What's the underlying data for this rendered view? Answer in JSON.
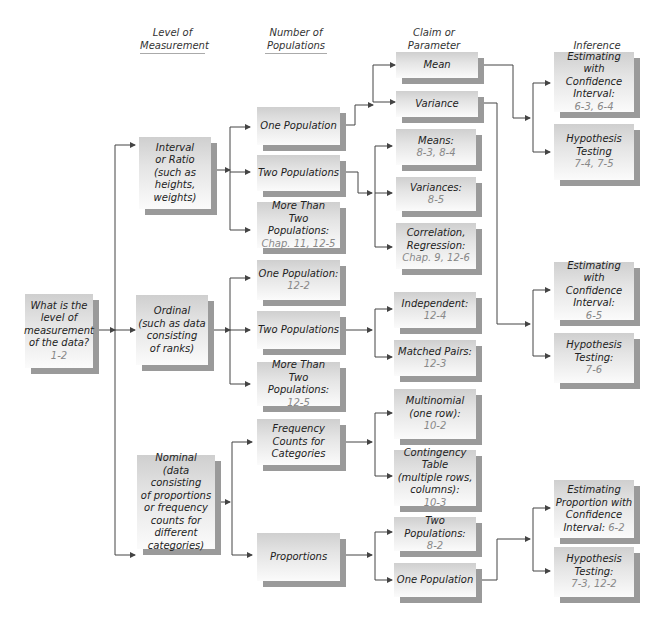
{
  "headers": {
    "level": "Level of Measurement",
    "level_l1": "Level of",
    "level_l2": "Measurement",
    "number_l1": "Number of",
    "number_l2": "Populations",
    "claim_l1": "Claim or",
    "claim_l2": "Parameter",
    "inference": "Inference"
  },
  "root": {
    "lines": [
      "What is the",
      "level of",
      "measurement",
      "of the data?"
    ],
    "ref": "1-2"
  },
  "levels": {
    "interval": {
      "lines": [
        "Interval",
        "or Ratio",
        "(such as",
        "heights,",
        "weights)"
      ]
    },
    "ordinal": {
      "lines": [
        "Ordinal",
        "(such as data",
        "consisting",
        "of ranks)"
      ]
    },
    "nominal": {
      "lines": [
        "Nominal",
        "(data consisting",
        "of proportions",
        "or frequency",
        "counts for",
        "different",
        "categories)"
      ]
    }
  },
  "populations": {
    "int_one": {
      "label": "One Population"
    },
    "int_two": {
      "label": "Two Populations"
    },
    "int_more": {
      "l1": "More Than",
      "l2": "Two Populations:",
      "ref": "Chap. 11, 12-5"
    },
    "ord_one": {
      "l1": "One Population:",
      "ref": "12-2"
    },
    "ord_two": {
      "label": "Two Populations"
    },
    "ord_more": {
      "l1": "More Than",
      "l2": "Two Populations:",
      "ref": "12-5"
    },
    "nom_freq": {
      "lines": [
        "Frequency",
        "Counts for",
        "Categories"
      ]
    },
    "nom_prop": {
      "label": "Proportions"
    }
  },
  "claims": {
    "mean": {
      "label": "Mean"
    },
    "variance": {
      "label": "Variance"
    },
    "means": {
      "l1": "Means:",
      "ref": "8-3, 8-4"
    },
    "variances": {
      "l1": "Variances:",
      "ref": "8-5"
    },
    "correlation": {
      "l1": "Correlation,",
      "l2": "Regression:",
      "ref": "Chap. 9, 12-6"
    },
    "independent": {
      "l1": "Independent:",
      "ref": "12-4"
    },
    "matched": {
      "l1": "Matched Pairs:",
      "ref": "12-3"
    },
    "multinomial": {
      "l1": "Multinomial",
      "l2": "(one row):",
      "ref": "10-2"
    },
    "contingency": {
      "l1": "Contingency Table",
      "l2": "(multiple rows,",
      "l3": "columns):",
      "ref": "10-3"
    },
    "two_pop": {
      "l1": "Two Populations:",
      "ref": "8-2"
    },
    "one_pop": {
      "label": "One Population"
    }
  },
  "inference": {
    "est1": {
      "l1": "Estimating",
      "l2": "with Confidence",
      "l3": "Interval:",
      "ref": "6-3, 6-4"
    },
    "hyp1": {
      "l1": "Hypothesis",
      "l2": "Testing",
      "ref": "7-4, 7-5"
    },
    "est2": {
      "l1": "Estimating",
      "l2": "with Confidence",
      "l3": "Interval:",
      "ref": "6-5"
    },
    "hyp2": {
      "l1": "Hypothesis",
      "l2": "Testing:",
      "ref": "7-6"
    },
    "est3": {
      "l1": "Estimating",
      "l2": "Proportion with",
      "l3": "Confidence",
      "l4": "Interval:",
      "ref": "6-2"
    },
    "hyp3": {
      "l1": "Hypothesis",
      "l2": "Testing:",
      "ref": "7-3, 12-2"
    }
  },
  "colors": {
    "line": "#444444",
    "shadow": "#9a9a9a",
    "ref_text": "#888888"
  }
}
